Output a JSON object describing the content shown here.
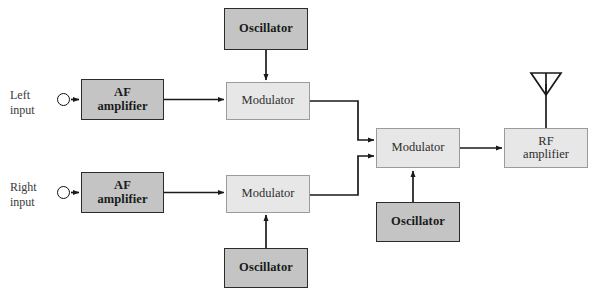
{
  "diagram": {
    "canvas": {
      "width": 596,
      "height": 296
    },
    "colors": {
      "background": "#ffffff",
      "solid_fill": "#c4c4c4",
      "solid_stroke": "#2b2b2b",
      "light_fill": "#e7e7e7",
      "light_stroke": "#9b9b9b",
      "wire": "#1a1a1a",
      "text": "#1a1a1a"
    },
    "inputs": [
      {
        "id": "left-input",
        "label": "Left\ninput",
        "x": 10,
        "y": 88
      },
      {
        "id": "right-input",
        "label": "Right\ninput",
        "x": 10,
        "y": 180
      }
    ],
    "nodes": [
      {
        "id": "oscillator-top",
        "label": "Oscillator",
        "style": "solid",
        "x": 224,
        "y": 8,
        "w": 84,
        "h": 42
      },
      {
        "id": "af-amplifier-left",
        "label": "AF\namplifier",
        "style": "solid",
        "x": 81,
        "y": 79,
        "w": 83,
        "h": 41
      },
      {
        "id": "modulator-upper",
        "label": "Modulator",
        "style": "light",
        "x": 226,
        "y": 82,
        "w": 84,
        "h": 38
      },
      {
        "id": "modulator-center",
        "label": "Modulator",
        "style": "light",
        "x": 376,
        "y": 128,
        "w": 84,
        "h": 40
      },
      {
        "id": "rf-amplifier",
        "label": "RF\namplifier",
        "style": "light",
        "x": 504,
        "y": 128,
        "w": 84,
        "h": 40
      },
      {
        "id": "af-amplifier-right",
        "label": "AF\namplifier",
        "style": "solid",
        "x": 81,
        "y": 172,
        "w": 83,
        "h": 41
      },
      {
        "id": "modulator-lower",
        "label": "Modulator",
        "style": "light",
        "x": 226,
        "y": 175,
        "w": 84,
        "h": 38
      },
      {
        "id": "oscillator-center",
        "label": "Oscillator",
        "style": "solid",
        "x": 376,
        "y": 202,
        "w": 84,
        "h": 40
      },
      {
        "id": "oscillator-bottom",
        "label": "Oscillator",
        "style": "solid",
        "x": 224,
        "y": 248,
        "w": 84,
        "h": 40
      }
    ],
    "antenna": {
      "id": "antenna",
      "label": "antenna",
      "x": 546,
      "y": 73,
      "width": 30,
      "height": 22
    },
    "connections": [
      {
        "from": "left-input",
        "to": "af-amplifier-left",
        "kind": "arrow"
      },
      {
        "from": "af-amplifier-left",
        "to": "modulator-upper",
        "kind": "arrow"
      },
      {
        "from": "oscillator-top",
        "to": "modulator-upper",
        "kind": "arrow"
      },
      {
        "from": "right-input",
        "to": "af-amplifier-right",
        "kind": "arrow"
      },
      {
        "from": "af-amplifier-right",
        "to": "modulator-lower",
        "kind": "arrow"
      },
      {
        "from": "oscillator-bottom",
        "to": "modulator-lower",
        "kind": "arrow"
      },
      {
        "from": "modulator-upper",
        "to": "modulator-center",
        "kind": "elbow-arrow"
      },
      {
        "from": "modulator-lower",
        "to": "modulator-center",
        "kind": "elbow-arrow"
      },
      {
        "from": "oscillator-center",
        "to": "modulator-center",
        "kind": "arrow"
      },
      {
        "from": "modulator-center",
        "to": "rf-amplifier",
        "kind": "arrow"
      },
      {
        "from": "rf-amplifier",
        "to": "antenna",
        "kind": "line"
      }
    ]
  }
}
